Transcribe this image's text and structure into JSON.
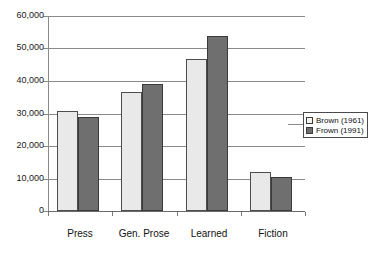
{
  "chart_data": {
    "type": "bar",
    "title": "",
    "subtitle": "",
    "xlabel": "",
    "ylabel": "",
    "categories": [
      "Press",
      "Gen. Prose",
      "Learned",
      "Fiction"
    ],
    "series": [
      {
        "name": "Brown (1961)",
        "color": "#e9e9e9",
        "values": [
          30800,
          36700,
          46800,
          11900
        ]
      },
      {
        "name": "Frown (1991)",
        "color": "#6f6f6f",
        "values": [
          29000,
          39200,
          53800,
          10600
        ]
      }
    ],
    "ylim": [
      0,
      60000
    ],
    "ytick_step": 10000,
    "ytick_labels": [
      "60,000",
      "50,000",
      "40,000",
      "30,000",
      "20,000",
      "10,000",
      "0"
    ],
    "ytick_values": [
      60000,
      50000,
      40000,
      30000,
      20000,
      10000,
      0
    ],
    "grid": true,
    "grid_axis": "y",
    "legend_position": "right",
    "annotations": []
  },
  "legend": {
    "entries": [
      {
        "label": "Brown (1961)"
      },
      {
        "label": "Frown (1991)"
      }
    ]
  }
}
